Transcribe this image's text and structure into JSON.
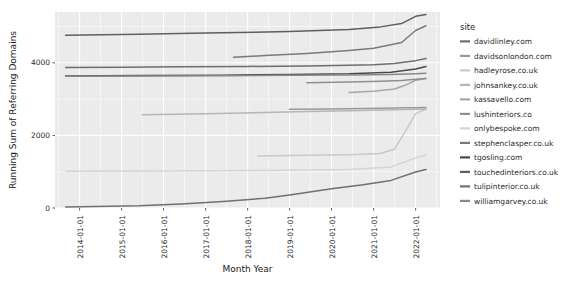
{
  "chart_data": {
    "type": "line",
    "title": "",
    "xlabel": "Month Year",
    "ylabel": "Running Sum of Referring Domains",
    "legend_title": "site",
    "legend_position": "right",
    "grid": true,
    "panel_background": "#ebebeb",
    "grid_color": "#ffffff",
    "xlim": [
      "2013-06-01",
      "2022-08-01"
    ],
    "ylim": [
      0,
      5400
    ],
    "yticks": [
      0,
      2000,
      4000
    ],
    "ytick_labels": [
      "0",
      "2000",
      "4000"
    ],
    "xticks": [
      "2014-01-01",
      "2015-01-01",
      "2016-01-01",
      "2017-01-01",
      "2018-01-01",
      "2019-01-01",
      "2020-01-01",
      "2021-01-01",
      "2022-01-01"
    ],
    "xtick_labels": [
      "2014-01-01",
      "2015-01-01",
      "2016-01-01",
      "2017-01-01",
      "2018-01-01",
      "2019-01-01",
      "2020-01-01",
      "2021-01-01",
      "2022-01-01"
    ],
    "series": [
      {
        "name": "davidlinley.com",
        "color": "#6e6e6e",
        "x": [
          "2013-09-01",
          "2015-01-01",
          "2016-06-01",
          "2018-01-01",
          "2019-06-01",
          "2020-06-01",
          "2021-01-01",
          "2021-07-01",
          "2022-01-01",
          "2022-04-01"
        ],
        "values": [
          3870,
          3880,
          3890,
          3900,
          3915,
          3930,
          3950,
          3980,
          4060,
          4120
        ]
      },
      {
        "name": "davidsonlondon.com",
        "color": "#999999",
        "x": [
          "2019-01-01",
          "2020-01-01",
          "2020-10-01",
          "2021-04-01",
          "2021-10-01",
          "2022-01-01",
          "2022-04-01"
        ],
        "values": [
          2720,
          2730,
          2740,
          2750,
          2760,
          2765,
          2770
        ]
      },
      {
        "name": "hadleyrose.co.uk",
        "color": "#c9c9c9",
        "x": [
          "2018-04-01",
          "2019-06-01",
          "2020-06-01",
          "2021-03-01",
          "2021-07-01",
          "2021-10-01",
          "2022-01-01",
          "2022-04-01"
        ],
        "values": [
          1430,
          1450,
          1470,
          1500,
          1620,
          2100,
          2600,
          2720
        ]
      },
      {
        "name": "johnsankey.co.uk",
        "color": "#b5b5b5",
        "x": [
          "2015-07-01",
          "2017-01-01",
          "2018-06-01",
          "2019-06-01",
          "2020-06-01",
          "2021-04-01",
          "2022-01-01",
          "2022-04-01"
        ],
        "values": [
          2570,
          2600,
          2630,
          2660,
          2680,
          2700,
          2720,
          2730
        ]
      },
      {
        "name": "kassavello.com",
        "color": "#a6a6a6",
        "x": [
          "2020-06-01",
          "2021-01-01",
          "2021-07-01",
          "2021-10-01",
          "2022-01-01",
          "2022-04-01"
        ],
        "values": [
          3180,
          3220,
          3280,
          3380,
          3520,
          3570
        ]
      },
      {
        "name": "lushinteriors.co",
        "color": "#8f8f8f",
        "x": [
          "2019-06-01",
          "2020-06-01",
          "2021-03-01",
          "2021-09-01",
          "2022-01-01",
          "2022-04-01"
        ],
        "values": [
          3450,
          3470,
          3490,
          3510,
          3550,
          3570
        ]
      },
      {
        "name": "onlybespoke.com",
        "color": "#d4d4d4",
        "x": [
          "2013-09-01",
          "2016-01-01",
          "2018-06-01",
          "2020-06-01",
          "2021-06-01",
          "2022-01-01",
          "2022-04-01"
        ],
        "values": [
          1010,
          1020,
          1035,
          1060,
          1130,
          1380,
          1460
        ]
      },
      {
        "name": "stephenclasper.co.uk",
        "color": "#7a7a7a",
        "x": [
          "2017-09-01",
          "2018-06-01",
          "2019-06-01",
          "2020-06-01",
          "2021-01-01",
          "2021-09-01",
          "2022-01-01",
          "2022-04-01"
        ],
        "values": [
          4150,
          4200,
          4260,
          4340,
          4400,
          4560,
          4890,
          5020
        ]
      },
      {
        "name": "tgosling.com",
        "color": "#4a4a4a",
        "x": [
          "2013-09-01",
          "2015-06-01",
          "2017-06-01",
          "2019-01-01",
          "2020-06-01",
          "2021-06-01",
          "2022-01-01",
          "2022-04-01"
        ],
        "values": [
          3640,
          3650,
          3660,
          3680,
          3700,
          3740,
          3830,
          3900
        ]
      },
      {
        "name": "touchedinteriors.co.uk",
        "color": "#5f5f5f",
        "x": [
          "2013-09-01",
          "2015-06-01",
          "2017-01-01",
          "2019-01-01",
          "2020-06-01",
          "2021-03-01",
          "2021-09-01",
          "2022-01-01",
          "2022-04-01"
        ],
        "values": [
          4760,
          4790,
          4820,
          4860,
          4920,
          4990,
          5080,
          5280,
          5330
        ]
      },
      {
        "name": "tulipinterior.co.uk",
        "color": "#707070",
        "x": [
          "2013-09-01",
          "2015-06-01",
          "2016-06-01",
          "2017-06-01",
          "2018-06-01",
          "2019-01-01",
          "2020-01-01",
          "2020-10-01",
          "2021-06-01",
          "2022-01-01",
          "2022-04-01"
        ],
        "values": [
          30,
          60,
          110,
          180,
          270,
          360,
          530,
          640,
          760,
          990,
          1060
        ]
      },
      {
        "name": "williamgarvey.co.uk",
        "color": "#888888",
        "x": [
          "2013-09-01",
          "2015-06-01",
          "2017-06-01",
          "2019-01-01",
          "2020-06-01",
          "2021-06-01",
          "2022-01-01",
          "2022-04-01"
        ],
        "values": [
          3630,
          3635,
          3645,
          3655,
          3665,
          3680,
          3700,
          3710
        ]
      }
    ]
  }
}
